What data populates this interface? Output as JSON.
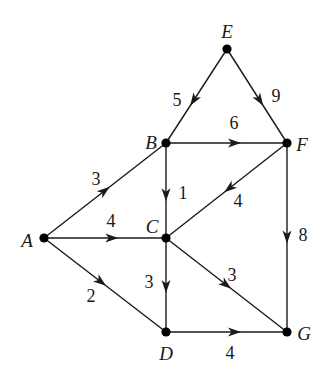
{
  "graph": {
    "type": "directed-weighted",
    "nodes": [
      {
        "id": "A",
        "label": "A",
        "x": 44,
        "y": 238,
        "lx": 27,
        "ly": 240
      },
      {
        "id": "B",
        "label": "B",
        "x": 166,
        "y": 143,
        "lx": 151,
        "ly": 142
      },
      {
        "id": "C",
        "label": "C",
        "x": 166,
        "y": 238,
        "lx": 152,
        "ly": 226
      },
      {
        "id": "D",
        "label": "D",
        "x": 166,
        "y": 332,
        "lx": 166,
        "ly": 353
      },
      {
        "id": "E",
        "label": "E",
        "x": 227,
        "y": 49,
        "lx": 227,
        "ly": 31
      },
      {
        "id": "F",
        "label": "F",
        "x": 287,
        "y": 143,
        "lx": 302,
        "ly": 144
      },
      {
        "id": "G",
        "label": "G",
        "x": 287,
        "y": 332,
        "lx": 304,
        "ly": 333
      }
    ],
    "edges": [
      {
        "from": "E",
        "to": "B",
        "weight": "5",
        "t": 0.55,
        "wx": 177,
        "wy": 100
      },
      {
        "from": "E",
        "to": "F",
        "weight": "9",
        "t": 0.55,
        "wx": 276,
        "wy": 96
      },
      {
        "from": "B",
        "to": "F",
        "weight": "6",
        "t": 0.57,
        "wx": 234,
        "wy": 123
      },
      {
        "from": "B",
        "to": "C",
        "weight": "1",
        "t": 0.55,
        "wx": 183,
        "wy": 193
      },
      {
        "from": "F",
        "to": "C",
        "weight": "4",
        "t": 0.48,
        "wx": 238,
        "wy": 201
      },
      {
        "from": "A",
        "to": "B",
        "weight": "3",
        "t": 0.5,
        "wx": 96,
        "wy": 179
      },
      {
        "from": "A",
        "to": "C",
        "weight": "4",
        "t": 0.56,
        "wx": 111,
        "wy": 221
      },
      {
        "from": "A",
        "to": "D",
        "weight": "2",
        "t": 0.47,
        "wx": 91,
        "wy": 296
      },
      {
        "from": "C",
        "to": "D",
        "weight": "3",
        "t": 0.52,
        "wx": 149,
        "wy": 282
      },
      {
        "from": "C",
        "to": "G",
        "weight": "3",
        "t": 0.5,
        "wx": 232,
        "wy": 275
      },
      {
        "from": "F",
        "to": "G",
        "weight": "8",
        "t": 0.5,
        "wx": 303,
        "wy": 235
      },
      {
        "from": "D",
        "to": "G",
        "weight": "4",
        "t": 0.57,
        "wx": 230,
        "wy": 353
      }
    ]
  },
  "colors": {
    "line": "#1a1a1a",
    "node": "#000000",
    "background": "#ffffff"
  }
}
